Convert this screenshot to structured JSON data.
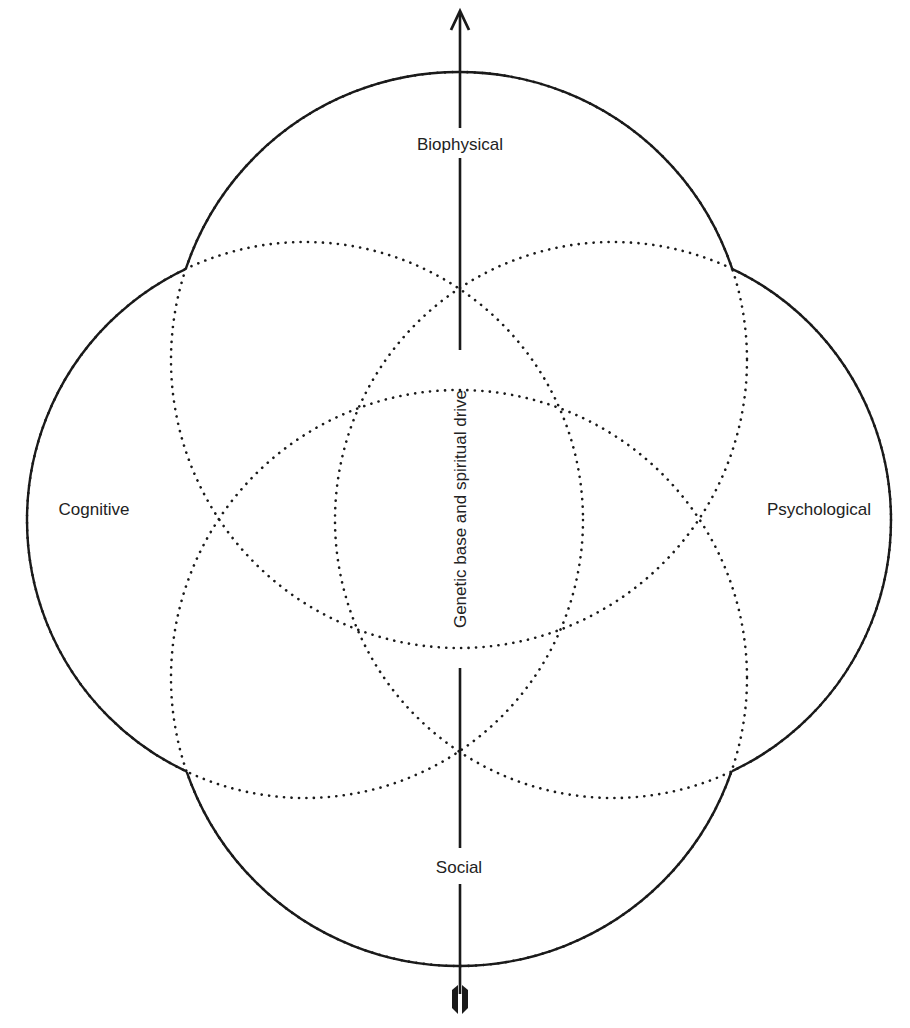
{
  "diagram": {
    "type": "four-overlapping-circles-with-vertical-axis",
    "labels": {
      "top": "Biophysical",
      "left": "Cognitive",
      "right": "Psychological",
      "bottom": "Social",
      "axis": "Genetic base and spiritual drive"
    },
    "colors": {
      "line": "#1a1a1a",
      "text": "#222222",
      "background": "#ffffff"
    },
    "circles": [
      {
        "name": "biophysical",
        "cx": 459,
        "cy": 360,
        "r": 288
      },
      {
        "name": "social",
        "cx": 459,
        "cy": 678,
        "r": 288
      },
      {
        "name": "cognitive",
        "cx": 305,
        "cy": 520,
        "r": 278
      },
      {
        "name": "psychological",
        "cx": 613,
        "cy": 520,
        "r": 278
      }
    ]
  }
}
